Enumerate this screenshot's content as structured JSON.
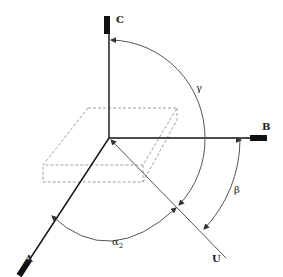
{
  "diagram": {
    "type": "3d-axis-orientation",
    "origin": {
      "x": 109,
      "y": 138
    },
    "axes": [
      {
        "id": "A",
        "label": "A",
        "end": {
          "x": 20,
          "y": 274
        }
      },
      {
        "id": "B",
        "label": "B",
        "end": {
          "x": 265,
          "y": 138
        }
      },
      {
        "id": "C",
        "label": "C",
        "end": {
          "x": 109,
          "y": 16
        }
      }
    ],
    "vector": {
      "id": "U",
      "label": "U"
    },
    "angles": [
      {
        "id": "gamma",
        "label": "γ",
        "between": [
          "C",
          "U"
        ]
      },
      {
        "id": "beta",
        "label": "β",
        "between": [
          "B",
          "U"
        ]
      },
      {
        "id": "alpha2",
        "label": "α",
        "subscript": "2",
        "between": [
          "A",
          "U"
        ]
      }
    ],
    "colors": {
      "axis": "#111111",
      "vector": "#555555",
      "arc": "#555555",
      "dashed_box": "#888888"
    }
  }
}
